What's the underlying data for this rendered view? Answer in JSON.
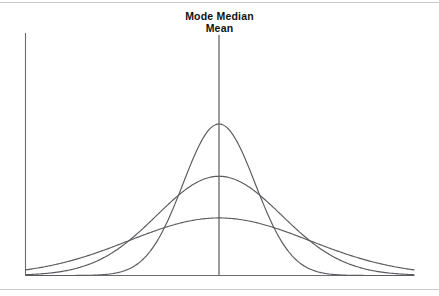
{
  "figure": {
    "background_color": "#ffffff",
    "frame_color": "#c9c9ce",
    "axis_color": "#6b6b72",
    "curve_color": "#5a5a60",
    "center_line_color": "#5a5a60"
  },
  "annotations": {
    "line1": "Mode Median",
    "line2": "Mean"
  },
  "chart_data": {
    "type": "line",
    "title": "",
    "subtitle": "",
    "xlabel": "",
    "ylabel": "",
    "grid": false,
    "legend_position": "none",
    "annotations": [
      {
        "text": "Mode Median",
        "x": 0,
        "role": "center-measures-label-line-1"
      },
      {
        "text": "Mean",
        "x": 0,
        "role": "center-measures-label-line-2"
      }
    ],
    "center_marker": {
      "label": "Mode = Median = Mean",
      "x": 0,
      "description": "vertical line at the common center of all three symmetric distributions"
    },
    "xlim": [
      -4.2,
      4.2
    ],
    "ylim": [
      0,
      1.0
    ],
    "x": [
      -4.2,
      -4.0,
      -3.8,
      -3.6,
      -3.4,
      -3.2,
      -3.0,
      -2.8,
      -2.6,
      -2.4,
      -2.2,
      -2.0,
      -1.8,
      -1.6,
      -1.4,
      -1.2,
      -1.0,
      -0.8,
      -0.6,
      -0.4,
      -0.2,
      0.0,
      0.2,
      0.4,
      0.6,
      0.8,
      1.0,
      1.2,
      1.4,
      1.6,
      1.8,
      2.0,
      2.2,
      2.4,
      2.6,
      2.8,
      3.0,
      3.2,
      3.4,
      3.6,
      3.8,
      4.0,
      4.2
    ],
    "series": [
      {
        "name": "Tall narrow normal curve",
        "peak_height": 1.0,
        "std_dev": 0.78,
        "mean": 0.0,
        "values": [
          0.0,
          0.0,
          0.0,
          0.001,
          0.002,
          0.003,
          0.006,
          0.012,
          0.022,
          0.038,
          0.065,
          0.104,
          0.159,
          0.231,
          0.32,
          0.424,
          0.535,
          0.645,
          0.747,
          0.85,
          0.935,
          1.0,
          0.935,
          0.85,
          0.747,
          0.645,
          0.535,
          0.424,
          0.32,
          0.231,
          0.159,
          0.104,
          0.065,
          0.038,
          0.022,
          0.012,
          0.006,
          0.003,
          0.002,
          0.001,
          0.0,
          0.0,
          0.0
        ]
      },
      {
        "name": "Medium normal curve",
        "peak_height": 0.655,
        "std_dev": 1.35,
        "mean": 0.0,
        "values": [
          0.005,
          0.009,
          0.014,
          0.022,
          0.032,
          0.046,
          0.065,
          0.089,
          0.118,
          0.152,
          0.192,
          0.237,
          0.286,
          0.337,
          0.39,
          0.442,
          0.491,
          0.537,
          0.576,
          0.609,
          0.635,
          0.655,
          0.635,
          0.609,
          0.576,
          0.537,
          0.491,
          0.442,
          0.39,
          0.337,
          0.286,
          0.237,
          0.192,
          0.152,
          0.118,
          0.089,
          0.065,
          0.046,
          0.032,
          0.022,
          0.014,
          0.009,
          0.005
        ]
      },
      {
        "name": "Short wide normal curve",
        "peak_height": 0.38,
        "std_dev": 1.95,
        "mean": 0.0,
        "values": [
          0.037,
          0.045,
          0.055,
          0.066,
          0.078,
          0.092,
          0.107,
          0.124,
          0.142,
          0.161,
          0.181,
          0.201,
          0.221,
          0.241,
          0.26,
          0.279,
          0.296,
          0.312,
          0.326,
          0.338,
          0.347,
          0.38,
          0.347,
          0.338,
          0.326,
          0.312,
          0.296,
          0.279,
          0.26,
          0.241,
          0.221,
          0.201,
          0.181,
          0.161,
          0.142,
          0.124,
          0.107,
          0.092,
          0.078,
          0.066,
          0.055,
          0.045,
          0.037
        ]
      }
    ]
  }
}
